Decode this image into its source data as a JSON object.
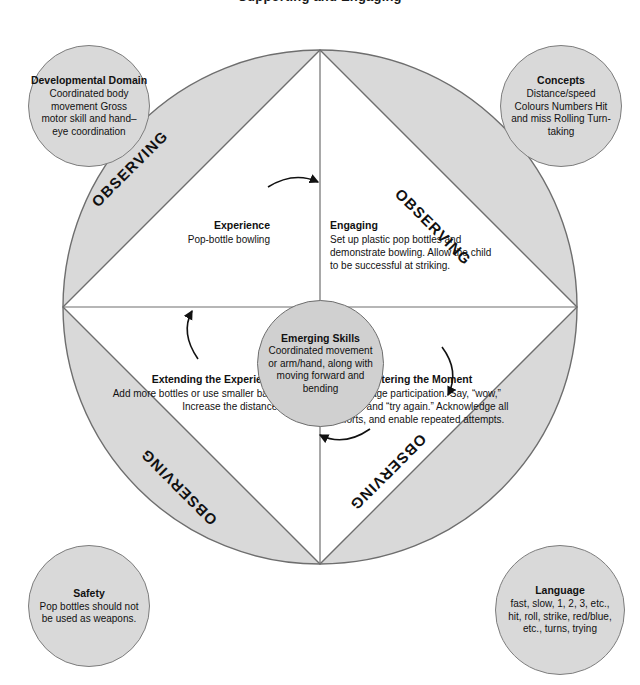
{
  "page": {
    "title": "Supporting and Engaging",
    "background_color": "#ffffff",
    "segment_fill": "#d9d9d9",
    "segment_stroke": "#6e6e6e"
  },
  "wheel": {
    "observing_label": "OBSERVING",
    "segments": [
      {
        "position": "top-left",
        "label": "OBSERVING"
      },
      {
        "position": "top-right",
        "label": "OBSERVING"
      },
      {
        "position": "bottom-left",
        "label": "OBSERVING"
      },
      {
        "position": "bottom-right",
        "label": "OBSERVING"
      }
    ],
    "flow_direction": "clockwise",
    "arrows": [
      "top-arrow",
      "right-arrow",
      "bottom-arrow",
      "left-arrow"
    ]
  },
  "centre": {
    "title": "Emerging Skills",
    "body": "Coordinated movement or arm/hand, along with moving forward and bending"
  },
  "quadrants": [
    {
      "id": "experience",
      "title": "Experience",
      "body": "Pop-bottle bowling"
    },
    {
      "id": "engaging",
      "title": "Engaging",
      "body": "Set up plastic pop bottles and demonstrate bowling. Allow the child to be successful at striking."
    },
    {
      "id": "extending",
      "title": "Extending the Experience",
      "body": "Add more bottles or use smaller balls. Increase the distance."
    },
    {
      "id": "entering",
      "title": "Entering the Moment",
      "body": "Encourage participation. Say, “wow,” “great,” and “try again.” Acknowledge all efforts, and enable repeated attempts."
    }
  ],
  "satellites": [
    {
      "id": "developmental-domain",
      "title": "Developmental Domain",
      "body": "Coordinated body movement Gross motor skill and hand–eye coordination"
    },
    {
      "id": "concepts",
      "title": "Concepts",
      "body": "Distance/speed Colours Numbers Hit and miss Rolling Turn-taking"
    },
    {
      "id": "safety",
      "title": "Safety",
      "body": "Pop bottles should not be used as weapons."
    },
    {
      "id": "language",
      "title": "Language",
      "body": "fast, slow, 1, 2, 3, etc., hit, roll, strike, red/blue, etc., turns, trying"
    }
  ]
}
